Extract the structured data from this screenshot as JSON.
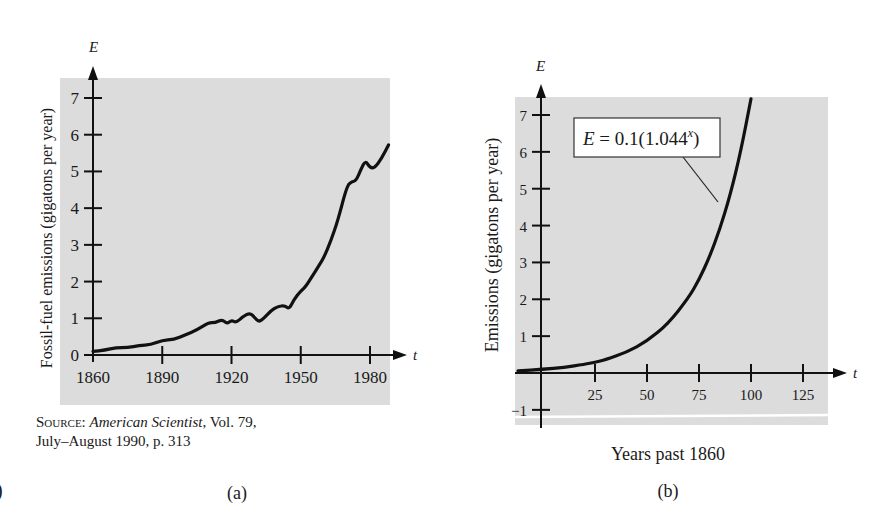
{
  "chart_data": [
    {
      "id": "a",
      "type": "line",
      "panel_label": "(a)",
      "title": "",
      "xlabel": "t",
      "ylabel": "Fossil-fuel emissions (gigatons per year)",
      "y_axis_letter": "E",
      "x_axis_letter": "t",
      "xlim": [
        1860,
        1990
      ],
      "ylim": [
        0,
        7.5
      ],
      "xticks": [
        1860,
        1890,
        1920,
        1950,
        1980
      ],
      "yticks": [
        0,
        1,
        2,
        3,
        4,
        5,
        6,
        7
      ],
      "grid": false,
      "background": "#dcdcdc",
      "series": [
        {
          "name": "Fossil-fuel emissions",
          "x": [
            1860,
            1865,
            1870,
            1875,
            1880,
            1885,
            1890,
            1895,
            1900,
            1905,
            1910,
            1913,
            1916,
            1918,
            1920,
            1922,
            1925,
            1928,
            1930,
            1932,
            1934,
            1937,
            1940,
            1943,
            1945,
            1947,
            1950,
            1952,
            1955,
            1958,
            1960,
            1963,
            1966,
            1970,
            1972,
            1974,
            1976,
            1978,
            1980,
            1982,
            1985,
            1988
          ],
          "values": [
            0.1,
            0.13,
            0.2,
            0.2,
            0.26,
            0.28,
            0.4,
            0.42,
            0.55,
            0.68,
            0.88,
            0.88,
            0.97,
            0.85,
            0.95,
            0.88,
            1.05,
            1.15,
            1.02,
            0.9,
            1.0,
            1.2,
            1.32,
            1.35,
            1.25,
            1.5,
            1.75,
            1.85,
            2.15,
            2.45,
            2.65,
            3.1,
            3.65,
            4.6,
            4.72,
            4.75,
            5.05,
            5.3,
            5.1,
            5.1,
            5.35,
            5.72
          ]
        }
      ],
      "source": {
        "prefix": "Source: ",
        "journal": "American Scientist",
        "rest": ", Vol. 79,",
        "line2": "July–August 1990, p. 313"
      }
    },
    {
      "id": "b",
      "type": "line",
      "panel_label": "(b)",
      "title": "",
      "xlabel": "Years past 1860",
      "ylabel": "Emissions (gigatons per year)",
      "y_axis_letter": "E",
      "x_axis_letter": "t",
      "xlim": [
        -12,
        140
      ],
      "ylim": [
        -1.3,
        7.5
      ],
      "xticks": [
        25,
        50,
        75,
        100,
        125
      ],
      "yticks": [
        -1,
        1,
        2,
        3,
        4,
        5,
        6,
        7
      ],
      "grid": false,
      "background": "#dcdcdc",
      "annotation": {
        "equation_prefix": "E",
        "equation_mid": " = 0.1(1.044",
        "equation_sup": "x",
        "equation_suffix": ")",
        "points_to_x": 89
      },
      "model": {
        "a": 0.1,
        "b": 1.044,
        "formula": "E = 0.1(1.044^x)"
      },
      "series": [
        {
          "name": "E = 0.1(1.044^x)",
          "x": [
            -12,
            0,
            10,
            20,
            25,
            30,
            40,
            50,
            60,
            70,
            75,
            80,
            85,
            90,
            95,
            100
          ],
          "values": [
            0.06,
            0.1,
            0.15,
            0.24,
            0.29,
            0.36,
            0.56,
            0.86,
            1.33,
            2.04,
            2.53,
            3.14,
            3.9,
            4.83,
            5.99,
            7.44
          ]
        }
      ]
    }
  ],
  "stray_edge_glyph": ")"
}
